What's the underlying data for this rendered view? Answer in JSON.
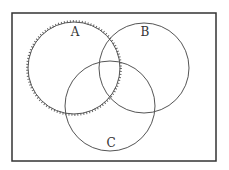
{
  "diagram": {
    "type": "venn",
    "frame": {
      "x": 12,
      "y": 13,
      "width": 204,
      "height": 148,
      "stroke": "#333333"
    },
    "sets": [
      {
        "id": "A",
        "label": "A",
        "cx": 74,
        "cy": 68,
        "r": 46,
        "stroke": "#555555",
        "boundary_style": "hatched"
      },
      {
        "id": "B",
        "label": "B",
        "cx": 144,
        "cy": 68,
        "r": 45,
        "stroke": "#555555",
        "boundary_style": "solid"
      },
      {
        "id": "C",
        "label": "C",
        "cx": 110,
        "cy": 106,
        "r": 45,
        "stroke": "#555555",
        "boundary_style": "solid"
      }
    ],
    "label_positions": {
      "A": {
        "x": 75,
        "y": 36
      },
      "B": {
        "x": 145,
        "y": 36
      },
      "C": {
        "x": 111,
        "y": 147
      }
    }
  }
}
